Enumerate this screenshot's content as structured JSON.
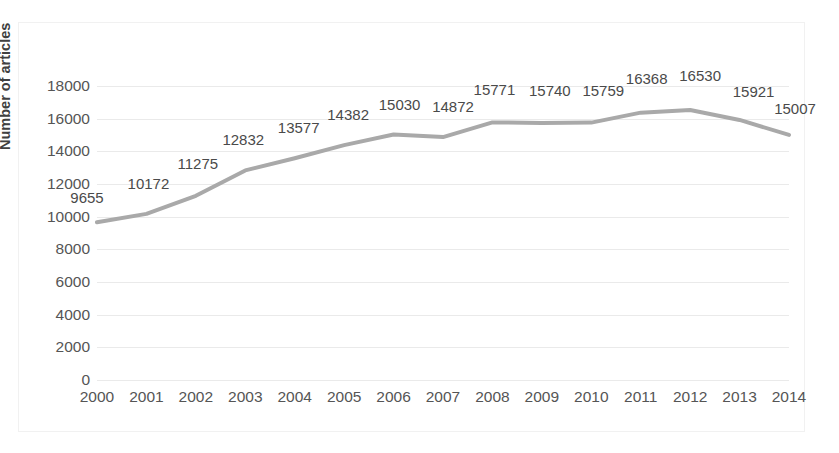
{
  "chart_data": {
    "type": "line",
    "title": "",
    "xlabel": "",
    "ylabel": "Number of articles",
    "categories": [
      "2000",
      "2001",
      "2002",
      "2003",
      "2004",
      "2005",
      "2006",
      "2007",
      "2008",
      "2009",
      "2010",
      "2011",
      "2012",
      "2013",
      "2014"
    ],
    "values": [
      9655,
      10172,
      11275,
      12832,
      13577,
      14382,
      15030,
      14872,
      15771,
      15740,
      15759,
      16368,
      16530,
      15921,
      15007
    ],
    "data_labels": [
      "9655",
      "10172",
      "11275",
      "12832",
      "13577",
      "14382",
      "15030",
      "14872",
      "15771",
      "15740",
      "15759",
      "16368",
      "16530",
      "15921",
      "15007"
    ],
    "ylim": [
      0,
      18000
    ],
    "ytick_labels": [
      "18000",
      "16000",
      "14000",
      "12000",
      "10000",
      "8000",
      "6000",
      "4000",
      "2000",
      "0"
    ],
    "ytick_values": [
      18000,
      16000,
      14000,
      12000,
      10000,
      8000,
      6000,
      4000,
      2000,
      0
    ],
    "grid": true,
    "legend": "none",
    "series_color": "#a9a9a9",
    "grid_color": "#eaeaea",
    "text_color": "#555555"
  }
}
